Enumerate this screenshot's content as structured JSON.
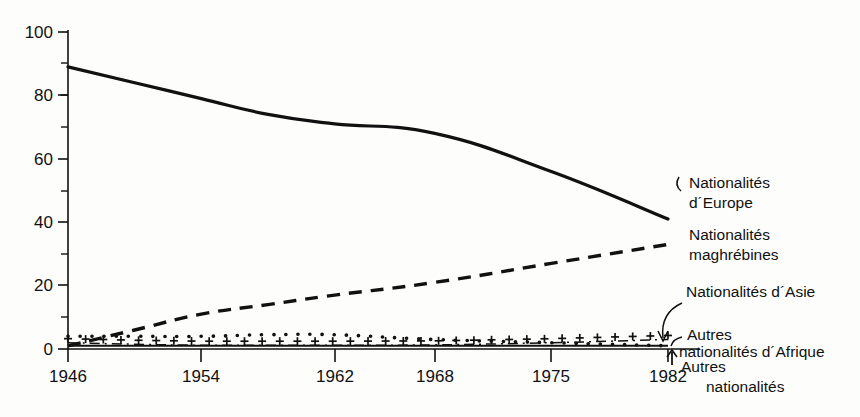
{
  "chart_data": {
    "type": "line",
    "title": "",
    "subtitle": "",
    "xlabel": "",
    "ylabel": "",
    "xlim": [
      1946,
      1982
    ],
    "ylim": [
      0,
      100
    ],
    "grid": false,
    "legend_position": "right-inline-annotations",
    "y_ticks": [
      0,
      20,
      40,
      60,
      80,
      100
    ],
    "y_tick_labels": [
      "0",
      "20",
      "40",
      "60",
      "80",
      "100"
    ],
    "y_minor_ticks": [
      10,
      30,
      50,
      70,
      90
    ],
    "x_ticks": [
      1946,
      1954,
      1962,
      1968,
      1975,
      1982
    ],
    "x_tick_labels": [
      "1946",
      "1954",
      "1962",
      "1968",
      "1975",
      "1982"
    ],
    "x": [
      1946,
      1950,
      1954,
      1958,
      1962,
      1968,
      1975,
      1982
    ],
    "series": [
      {
        "name": "Nationalités d´Europe",
        "style": "solid",
        "values": [
          89,
          84,
          79,
          74,
          71,
          68,
          56,
          41
        ]
      },
      {
        "name": "Nationalités maghrébines",
        "style": "dashed",
        "values": [
          1,
          6,
          11,
          14,
          17,
          21,
          27,
          33
        ]
      },
      {
        "name": "Nationalités d´Asie",
        "style": "dotted",
        "values": [
          4,
          4,
          4,
          4.5,
          4.5,
          3,
          2,
          1
        ]
      },
      {
        "name": "Autres nationalités d´Afrique",
        "style": "dash-dot-plus",
        "values": [
          2,
          1.5,
          1.2,
          1.2,
          1.2,
          1.3,
          2,
          3
        ]
      },
      {
        "name": "Autres nationalités",
        "style": "thin-solid",
        "values": [
          1,
          1,
          1,
          1,
          1,
          1,
          1,
          1
        ]
      }
    ],
    "annotations": [
      {
        "id": "europe",
        "line1": "Nationalités",
        "line2": "d´Europe"
      },
      {
        "id": "maghreb",
        "line1": "Nationalités",
        "line2": "maghrébines"
      },
      {
        "id": "asie",
        "line1": "Nationalités d´Asie",
        "line2": ""
      },
      {
        "id": "afrique",
        "line1": "Autres",
        "line2": "nationalités d´Afrique"
      },
      {
        "id": "autres",
        "line1": "Autres",
        "line2": "nationalités"
      }
    ]
  },
  "axis": {
    "y_labels": [
      "100",
      "80",
      "60",
      "40",
      "20",
      "0"
    ],
    "x_labels": [
      "1946",
      "1954",
      "1962",
      "1968",
      "1975",
      "1982"
    ]
  },
  "annotations": {
    "europe_l1": "Nationalités",
    "europe_l2": "d´Europe",
    "maghreb_l1": "Nationalités",
    "maghreb_l2": "maghrébines",
    "asie_l1": "Nationalités d´Asie",
    "afrique_l1": "Autres",
    "afrique_l2": "nationalités d´Afrique",
    "autres_l1": "Autres",
    "autres_l2": "nationalités"
  },
  "colors": {
    "ink": "#111111",
    "background": "#fdfdfc"
  }
}
